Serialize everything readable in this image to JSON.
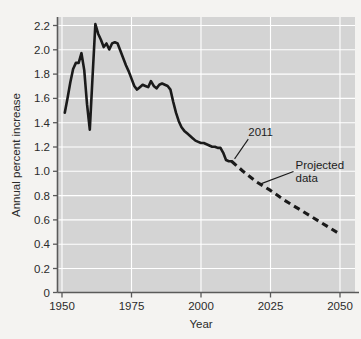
{
  "chart_data": {
    "type": "line",
    "title": "",
    "subtitle": "",
    "xlabel": "Year",
    "ylabel": "Annual percent increase",
    "xlim": [
      1950,
      2050
    ],
    "ylim": [
      0,
      2.3
    ],
    "xticks": [
      1950,
      1975,
      2000,
      2025,
      2050
    ],
    "xtick_labels": [
      "1950",
      "1975",
      "2000",
      "2025",
      "2050"
    ],
    "yticks": [
      0,
      0.2,
      0.4,
      0.6,
      0.8,
      1.0,
      1.2,
      1.4,
      1.6,
      1.8,
      2.0,
      2.2
    ],
    "ytick_labels": [
      "0",
      "0.2",
      "0.4",
      "0.6",
      "0.8",
      "1.0",
      "1.2",
      "1.4",
      "1.6",
      "1.8",
      "2.0",
      "2.2"
    ],
    "grid": true,
    "grid_color": "#ffffff",
    "plot_background": "#d4d4d4",
    "figure_background": "#f4f3f1",
    "line_color": "#1a1a1a",
    "legend": null,
    "legend_position": "none",
    "series": [
      {
        "name": "Historical data",
        "style": "solid",
        "x": [
          1951,
          1952,
          1953,
          1954,
          1955,
          1956,
          1957,
          1958,
          1959,
          1960,
          1961,
          1962,
          1963,
          1964,
          1965,
          1966,
          1967,
          1968,
          1969,
          1970,
          1971,
          1972,
          1973,
          1974,
          1975,
          1976,
          1977,
          1978,
          1979,
          1980,
          1981,
          1982,
          1983,
          1984,
          1985,
          1986,
          1987,
          1988,
          1989,
          1990,
          1991,
          1992,
          1993,
          1994,
          1995,
          1996,
          1997,
          1998,
          1999,
          2000,
          2001,
          2002,
          2003,
          2004,
          2005,
          2006,
          2007,
          2008,
          2009,
          2010,
          2011
        ],
        "y": [
          1.48,
          1.6,
          1.73,
          1.84,
          1.89,
          1.89,
          1.97,
          1.83,
          1.55,
          1.34,
          1.78,
          2.21,
          2.13,
          2.08,
          2.02,
          2.05,
          2.0,
          2.05,
          2.06,
          2.05,
          1.99,
          1.93,
          1.87,
          1.82,
          1.76,
          1.7,
          1.67,
          1.69,
          1.71,
          1.7,
          1.69,
          1.74,
          1.7,
          1.68,
          1.71,
          1.72,
          1.71,
          1.7,
          1.67,
          1.57,
          1.48,
          1.41,
          1.36,
          1.33,
          1.31,
          1.29,
          1.27,
          1.25,
          1.24,
          1.23,
          1.23,
          1.22,
          1.21,
          1.2,
          1.2,
          1.19,
          1.19,
          1.15,
          1.09,
          1.08,
          1.08
        ]
      },
      {
        "name": "Projected data",
        "style": "dashed",
        "x": [
          2011,
          2015,
          2020,
          2025,
          2030,
          2035,
          2040,
          2045,
          2050
        ],
        "y": [
          1.08,
          1.0,
          0.91,
          0.84,
          0.76,
          0.69,
          0.62,
          0.55,
          0.48
        ]
      }
    ],
    "annotations": [
      {
        "name": "year-2011-annotation",
        "text": "2011",
        "label_x": 2017,
        "label_y": 1.32,
        "point_x": 2011,
        "point_y": 1.1
      },
      {
        "name": "projected-data-annotation",
        "text_line1": "Projected",
        "text_line2": "data",
        "label_x": 2034,
        "label_y": 1.02,
        "point_x": 2021,
        "point_y": 0.89
      }
    ]
  }
}
